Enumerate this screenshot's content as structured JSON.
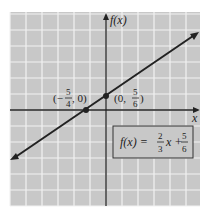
{
  "chart_data": {
    "type": "line",
    "title": "",
    "xlabel": "x",
    "ylabel": "f(x)",
    "equation": "f(x) = 2/3 x + 5/6",
    "slope": 0.6667,
    "intercept": 0.8333,
    "xlim": [
      -6,
      6
    ],
    "ylim": [
      -6,
      6
    ],
    "grid": true,
    "points": [
      {
        "x": -1.25,
        "y": 0,
        "label_prefix": "(−",
        "num": "5",
        "den": "4",
        "label_suffix": ", 0)"
      },
      {
        "x": 0,
        "y": 0.8333,
        "label_prefix": "(0, ",
        "num": "5",
        "den": "6",
        "label_suffix": ")"
      }
    ],
    "line_segment": {
      "x_start": -6.0,
      "x_end": 5.75
    }
  },
  "labels": {
    "y_axis": "f(x)",
    "x_axis": "x",
    "eq_lhs": "f(x) =",
    "eq_frac1_num": "2",
    "eq_frac1_den": "3",
    "eq_mid": "x +",
    "eq_frac2_num": "5",
    "eq_frac2_den": "6",
    "p1_open": "(−",
    "p1_num": "5",
    "p1_den": "4",
    "p1_close": ", 0)",
    "p2_open": "(0,",
    "p2_num": "5",
    "p2_den": "6",
    "p2_close": ")"
  },
  "colors": {
    "grid_bg": "#c8c8c8",
    "grid_line": "#f2f2f2",
    "ink": "#222222"
  }
}
